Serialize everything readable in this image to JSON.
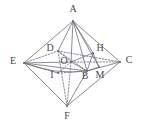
{
  "figure": {
    "type": "geometry-diagram",
    "width": 141,
    "height": 125,
    "background_color": "#ffffff",
    "stroke_color": "#6e6e78",
    "label_color": "#4a4a52",
    "vertices": [
      {
        "id": "A",
        "label": "A",
        "x": 73,
        "y": 21,
        "label_x": 73,
        "label_y": 9
      },
      {
        "id": "E",
        "label": "E",
        "x": 24,
        "y": 63,
        "label_x": 13,
        "label_y": 61
      },
      {
        "id": "C",
        "label": "C",
        "x": 120,
        "y": 62,
        "label_x": 129,
        "label_y": 60
      },
      {
        "id": "F",
        "label": "F",
        "x": 67,
        "y": 106,
        "label_x": 67,
        "label_y": 116
      },
      {
        "id": "D",
        "label": "D",
        "x": 58,
        "y": 51,
        "label_x": 50,
        "label_y": 48
      },
      {
        "id": "B",
        "label": "B",
        "x": 87,
        "y": 71,
        "label_x": 85,
        "label_y": 76
      },
      {
        "id": "O",
        "label": "O",
        "x": 71,
        "y": 62,
        "label_x": 64,
        "label_y": 61
      },
      {
        "id": "H",
        "label": "H",
        "x": 93,
        "y": 53,
        "label_x": 100,
        "label_y": 48
      },
      {
        "id": "I",
        "label": "I",
        "x": 58,
        "y": 73,
        "label_x": 52,
        "label_y": 75
      },
      {
        "id": "M",
        "label": "M",
        "x": 99,
        "y": 67,
        "label_x": 100,
        "label_y": 75
      }
    ],
    "edges_solid": [
      {
        "from": "A",
        "to": "E"
      },
      {
        "from": "A",
        "to": "C"
      },
      {
        "from": "A",
        "to": "O"
      },
      {
        "from": "A",
        "to": "B"
      },
      {
        "from": "A",
        "to": "H"
      },
      {
        "from": "A",
        "to": "M"
      },
      {
        "from": "E",
        "to": "F"
      },
      {
        "from": "C",
        "to": "F"
      },
      {
        "from": "E",
        "to": "B"
      },
      {
        "from": "B",
        "to": "C"
      },
      {
        "from": "B",
        "to": "F"
      },
      {
        "from": "E",
        "to": "O"
      },
      {
        "from": "E",
        "to": "I"
      },
      {
        "from": "B",
        "to": "H"
      },
      {
        "from": "O",
        "to": "B"
      },
      {
        "from": "O",
        "to": "H"
      },
      {
        "from": "H",
        "to": "M"
      },
      {
        "from": "B",
        "to": "M"
      },
      {
        "from": "A",
        "to": "D"
      }
    ],
    "edges_dashed": [
      {
        "from": "E",
        "to": "D"
      },
      {
        "from": "D",
        "to": "C"
      },
      {
        "from": "D",
        "to": "F"
      },
      {
        "from": "D",
        "to": "O"
      },
      {
        "from": "O",
        "to": "C"
      },
      {
        "from": "O",
        "to": "F"
      },
      {
        "from": "O",
        "to": "I"
      },
      {
        "from": "I",
        "to": "B"
      },
      {
        "from": "D",
        "to": "B"
      }
    ],
    "curves": [
      {
        "id": "arc-E-I-B",
        "from": "E",
        "to": "B",
        "via": "I",
        "bulge": 4
      }
    ]
  }
}
